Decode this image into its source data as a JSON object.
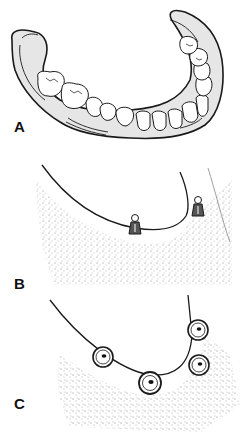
{
  "figure": {
    "panels": [
      {
        "id": "A",
        "label": "A",
        "description": "Lower complete denture (mandibular) with full arch of artificial teeth"
      },
      {
        "id": "B",
        "label": "B",
        "description": "Edentulous mandibular ridge with two ball-attachment implants"
      },
      {
        "id": "C",
        "label": "C",
        "description": "Occlusal view of mandibular ridge with four implant abutments"
      }
    ]
  },
  "colors": {
    "line": "#1a1a1a",
    "denture_base": "#e6e6e6",
    "tooth": "#ffffff",
    "stipple": "#333333",
    "background": "#ffffff"
  }
}
